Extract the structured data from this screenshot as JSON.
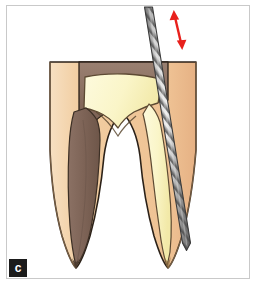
{
  "figure": {
    "panel_label": "c",
    "caption_text": "",
    "background_color": "#ffffff",
    "frame_color": "#c9c9c9",
    "label_background_color": "#1b1b1b",
    "label_text_color": "#ffffff"
  },
  "colors": {
    "enamel_dentin": "#f0c89a",
    "enamel_dentin_light": "#f6dcb9",
    "enamel_dentin_shadow": "#e0b184",
    "pulp_cream": "#faf5c8",
    "pulp_cream_deep": "#f5eeac",
    "pulp_brown": "#7d6356",
    "pulp_brown_light": "#8d7265",
    "outline": "#2b2118",
    "outline_soft": "#6a5240",
    "file_gray_light": "#d8d8d8",
    "file_gray_mid": "#9a9a9a",
    "file_gray_dark": "#5a5a5a",
    "file_outline": "#3a3a3a",
    "arrow_red": "#e8201c"
  },
  "elements": {
    "tooth_label": "molar-cross-section",
    "crown_label": "crown-access-cavity",
    "mesial_root_label": "mesial-root",
    "distal_root_label": "distal-root",
    "pulp_chamber_label": "pulp-chamber",
    "mesial_canal_label": "mesial-root-canal",
    "distal_canal_label": "distal-root-canal",
    "file_label": "endodontic-file",
    "arrow_label": "filing-motion-arrow"
  },
  "geometry": {
    "panel_width": 257,
    "panel_height": 286,
    "tooth_top_y": 62,
    "tooth_apex_y": 268,
    "file_tip": {
      "x": 186,
      "y": 248
    },
    "file_top": {
      "x": 146,
      "y": 8
    },
    "arrow_top": {
      "x": 174,
      "y": 12
    },
    "arrow_bottom": {
      "x": 182,
      "y": 48
    }
  }
}
